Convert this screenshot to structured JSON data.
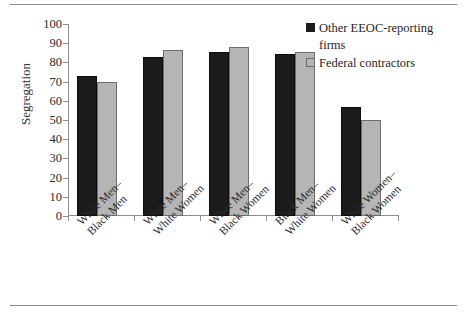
{
  "chart_data": {
    "type": "bar",
    "title": "",
    "xlabel": "",
    "ylabel": "Segregation",
    "ylim": [
      0,
      100
    ],
    "yticks": [
      0,
      10,
      20,
      30,
      40,
      50,
      60,
      70,
      80,
      90,
      100
    ],
    "grid": false,
    "legend_position": "top-right",
    "categories": [
      "White Men–\nBlack Men",
      "White Men–\nWhite Women",
      "White Men–\nBlack Women",
      "Black Men–\nWhite Women",
      "White Women–\nBlack Women"
    ],
    "category_lines": [
      [
        "White Men–",
        "Black Men"
      ],
      [
        "White Men–",
        "White Women"
      ],
      [
        "White Men–",
        "Black Women"
      ],
      [
        "Black Men–",
        "White Women"
      ],
      [
        "White Women–",
        "Black Women"
      ]
    ],
    "series": [
      {
        "name": "Other EEOC-reporting firms",
        "color": "#1b1b1b",
        "values": [
          73,
          83,
          85.5,
          84.5,
          57
        ]
      },
      {
        "name": "Federal contractors",
        "color": "#b5b5b5",
        "values": [
          70,
          86.5,
          88,
          85.5,
          50
        ]
      }
    ]
  },
  "legend": {
    "items": [
      {
        "label_line1": "Other EEOC-reporting",
        "label_line2": "firms",
        "swatch": "dark"
      },
      {
        "label_line1": "Federal contractors",
        "label_line2": "",
        "swatch": "light"
      }
    ]
  },
  "colors": {
    "series_dark": "#1b1b1b",
    "series_light": "#b5b5b5",
    "axis": "#8f8f8f",
    "rule": "#8a8a8a",
    "background": "#ffffff"
  }
}
